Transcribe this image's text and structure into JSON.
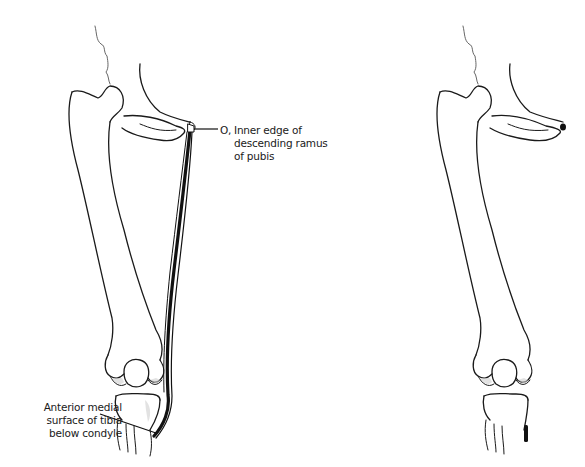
{
  "figure": {
    "panels": [
      {
        "id": "left",
        "description": "Pelvis, femur, knee and tibia with gracilis muscle drawn from pubis to tibia"
      },
      {
        "id": "right",
        "description": "Same skeleton showing only attachment points (black marks) of origin and insertion"
      }
    ]
  },
  "labels": {
    "origin": {
      "marker": "O,",
      "lines": [
        "Inner edge of",
        "descending ramus",
        "of pubis"
      ]
    },
    "insertion": {
      "lines": [
        "Anterior medial",
        "surface of tibia",
        "below condyle"
      ]
    }
  },
  "colors": {
    "ink": "#1a1a1a",
    "shade": "#bdbdbd",
    "muscle": "#111111",
    "background": "#ffffff"
  }
}
